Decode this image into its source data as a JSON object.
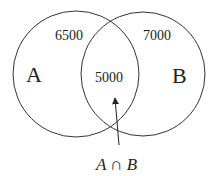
{
  "diagram": {
    "type": "venn",
    "sets": [
      {
        "name": "A",
        "only_value": "6500"
      },
      {
        "name": "B",
        "only_value": "7000"
      }
    ],
    "intersection": {
      "value": "5000",
      "label": "A ∩ B"
    }
  },
  "labels": {
    "set_a": "A",
    "set_b": "B",
    "a_only": "6500",
    "b_only": "7000",
    "intersection_value": "5000",
    "intersection_label": "A ∩ B"
  }
}
